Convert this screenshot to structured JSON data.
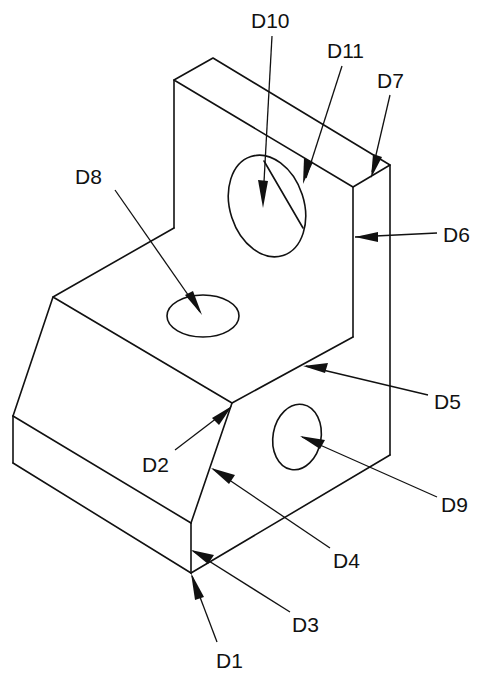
{
  "diagram": {
    "type": "isometric-part-drawing",
    "labels": {
      "D1": "D1",
      "D2": "D2",
      "D3": "D3",
      "D4": "D4",
      "D5": "D5",
      "D6": "D6",
      "D7": "D7",
      "D8": "D8",
      "D9": "D9",
      "D10": "D10",
      "D11": "D11"
    }
  }
}
